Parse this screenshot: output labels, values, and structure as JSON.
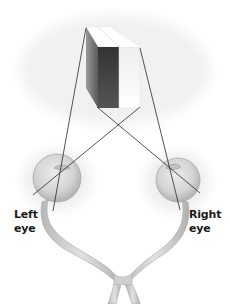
{
  "diagram": {
    "object": {
      "kind": "cube-icon"
    },
    "labels": {
      "left_eye_line1": "Left",
      "left_eye_line2": "eye",
      "right_eye_line1": "Right",
      "right_eye_line2": "eye"
    },
    "colors": {
      "background": "#ffffff",
      "line": "#2a2a2a",
      "cube_top": "#ffffff",
      "cube_left_dark": "#3a3a3a",
      "cube_front_mid": "#4a4a4a",
      "cube_front_light": "#f4f4f4",
      "eye_fill": "#d6d6d6",
      "nerve_fill": "#cfcfcf",
      "label_text": "#1a1a1a"
    }
  }
}
